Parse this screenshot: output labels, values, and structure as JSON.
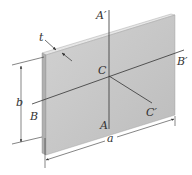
{
  "figure": {
    "labels": {
      "t": "t",
      "a_prime": "A′",
      "b_prime": "B′",
      "c": "C",
      "c_prime": "C′",
      "b_dim": "b",
      "b_axis": "B",
      "a_axis": "A",
      "a_dim": "a"
    },
    "colors": {
      "plate_face": "#c8c8c8",
      "plate_edge": "#e4e4e4",
      "plate_side": "#a8a8a8",
      "line": "#333333"
    }
  }
}
